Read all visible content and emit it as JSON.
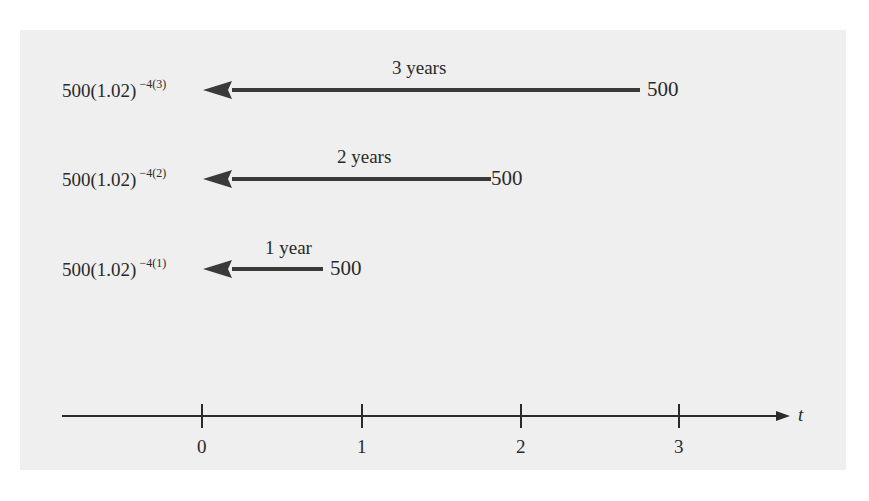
{
  "figure": {
    "rows": [
      {
        "present_value": "500(1.02)",
        "exponent": "−4(3)",
        "duration": "3 years",
        "future_value": "500",
        "arrow_from_t": 3,
        "arrow_to_t": 0
      },
      {
        "present_value": "500(1.02)",
        "exponent": "−4(2)",
        "duration": "2 years",
        "future_value": "500",
        "arrow_from_t": 2,
        "arrow_to_t": 0
      },
      {
        "present_value": "500(1.02)",
        "exponent": "−4(1)",
        "duration": "1 year",
        "future_value": "500",
        "arrow_from_t": 1,
        "arrow_to_t": 0
      }
    ],
    "axis": {
      "variable": "t",
      "ticks": [
        "0",
        "1",
        "2",
        "3"
      ]
    },
    "colors": {
      "page_background": "#efefef",
      "ink": "#2a2a2a",
      "arrow": "#3a3a3a"
    }
  }
}
